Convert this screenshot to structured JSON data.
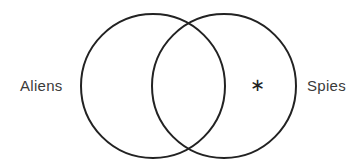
{
  "diagram": {
    "type": "venn",
    "sets": [
      {
        "id": "aliens",
        "label": "Aliens",
        "cx": 153,
        "cy": 86,
        "r": 72
      },
      {
        "id": "spies",
        "label": "Spies",
        "cx": 224,
        "cy": 86,
        "r": 72
      }
    ],
    "marker": {
      "symbol": "∗",
      "region": "spies-only",
      "x": 256,
      "y": 85
    },
    "stroke_color": "#222222",
    "text_color": "#3a3a3a",
    "background": "#ffffff"
  }
}
